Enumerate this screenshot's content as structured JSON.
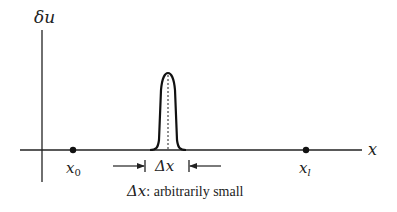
{
  "diagram": {
    "y_axis_label": "δu",
    "x_axis_label": "x",
    "point_left_label": "x",
    "point_left_sub": "0",
    "point_right_label": "x",
    "point_right_sub": "l",
    "width_label": "Δx",
    "caption_symbol": "Δx",
    "caption_text": ": arbitrarily small",
    "colors": {
      "ink": "#222222",
      "background": "#ffffff"
    }
  }
}
